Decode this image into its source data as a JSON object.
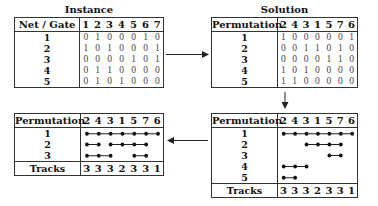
{
  "columns_original": [
    "1",
    "2",
    "3",
    "4",
    "5",
    "6",
    "7"
  ],
  "columns_permuted": [
    "2",
    "4",
    "3",
    "1",
    "5",
    "7",
    "6"
  ],
  "instance": {
    "title": "Instance",
    "row_header": "Net / Gate",
    "rows": [
      {
        "label": "1",
        "values": [
          0,
          1,
          0,
          0,
          0,
          1,
          0
        ]
      },
      {
        "label": "2",
        "values": [
          1,
          0,
          1,
          0,
          0,
          0,
          1
        ]
      },
      {
        "label": "3",
        "values": [
          0,
          0,
          0,
          0,
          1,
          0,
          1
        ]
      },
      {
        "label": "4",
        "values": [
          0,
          1,
          1,
          0,
          0,
          0,
          0
        ]
      },
      {
        "label": "5",
        "values": [
          0,
          1,
          0,
          1,
          0,
          0,
          0
        ]
      }
    ]
  },
  "solution": {
    "title": "Solution",
    "row_header": "Permutation",
    "rows": [
      {
        "label": "1",
        "values": [
          1,
          0,
          0,
          0,
          0,
          0,
          1
        ]
      },
      {
        "label": "2",
        "values": [
          0,
          0,
          1,
          1,
          0,
          1,
          0
        ]
      },
      {
        "label": "3",
        "values": [
          0,
          0,
          0,
          0,
          1,
          1,
          0
        ]
      },
      {
        "label": "4",
        "values": [
          1,
          0,
          1,
          0,
          0,
          0,
          0
        ]
      },
      {
        "label": "5",
        "values": [
          1,
          1,
          0,
          0,
          0,
          0,
          0
        ]
      }
    ]
  },
  "intervals": {
    "row_header": "Permutation",
    "footer_label": "Tracks",
    "tracks": [
      "3",
      "3",
      "3",
      "2",
      "3",
      "3",
      "1"
    ],
    "rows": [
      {
        "label": "1",
        "segments": [
          [
            0,
            6
          ]
        ]
      },
      {
        "label": "2",
        "segments": [
          [
            2,
            5
          ]
        ]
      },
      {
        "label": "3",
        "segments": [
          [
            4,
            5
          ]
        ]
      },
      {
        "label": "4",
        "segments": [
          [
            0,
            2
          ]
        ]
      },
      {
        "label": "5",
        "segments": [
          [
            0,
            1
          ]
        ]
      }
    ]
  },
  "packed": {
    "row_header": "Permutation",
    "footer_label": "Tracks",
    "tracks": [
      "3",
      "3",
      "3",
      "2",
      "3",
      "3",
      "1"
    ],
    "rows": [
      {
        "label": "1",
        "segments": [
          [
            0,
            6
          ]
        ]
      },
      {
        "label": "2",
        "segments": [
          [
            0,
            1
          ],
          [
            2,
            5
          ]
        ]
      },
      {
        "label": "3",
        "segments": [
          [
            0,
            2
          ],
          [
            4,
            5
          ]
        ]
      }
    ]
  }
}
